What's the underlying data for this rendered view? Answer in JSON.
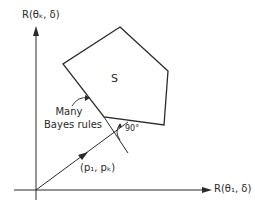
{
  "diagram": {
    "y_axis_label": "R(θₖ, δ)",
    "x_axis_label": "R(θ₁, δ)",
    "set_label": "S",
    "bayes_label_line1": "Many",
    "bayes_label_line2": "Bayes rules",
    "angle_label": "90°",
    "vector_label": "(p₁, pₖ)",
    "line_color": "#2a2a2a"
  }
}
